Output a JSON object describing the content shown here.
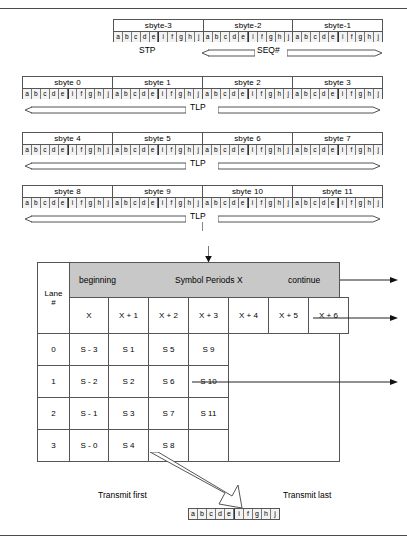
{
  "figure": {
    "bit_labels": [
      "a",
      "b",
      "c",
      "d",
      "e",
      "i",
      "f",
      "g",
      "h",
      "j"
    ],
    "colors": {
      "header_band_gray": "#c8c8c8",
      "cell_gray": "#f2f2f2",
      "line": "#555555",
      "rule": "#4c4c4c"
    }
  },
  "rows": [
    {
      "name": "stp-seq-row",
      "sbytes": [
        "sbyte-3",
        "sbyte-2",
        "sbyte-1"
      ],
      "annotations": {
        "left_label": "STP",
        "right_label": "SEQ#"
      }
    },
    {
      "name": "tlp-row-0",
      "sbytes": [
        "sbyte 0",
        "sbyte 1",
        "sbyte 2",
        "sbyte 3"
      ],
      "annotations": {
        "center_label": "TLP"
      }
    },
    {
      "name": "tlp-row-1",
      "sbytes": [
        "sbyte 4",
        "sbyte 5",
        "sbyte 6",
        "sbyte 7"
      ],
      "annotations": {
        "center_label": "TLP"
      }
    },
    {
      "name": "tlp-row-2",
      "sbytes": [
        "sbyte 8",
        "sbyte 9",
        "sbyte 10",
        "sbyte 11"
      ],
      "annotations": {
        "center_label": "TLP"
      }
    }
  ],
  "lane_table": {
    "band_labels": {
      "beginning": "beginning",
      "middle": "Symbol Periods X",
      "continue": "continue"
    },
    "lane_header": {
      "line1": "Lane",
      "line2": "#"
    },
    "symbol_period_columns": [
      "X",
      "X + 1",
      "X + 2",
      "X + 3",
      "X + 4",
      "X + 5",
      "X + 6"
    ],
    "lane_rows": [
      {
        "lane": "0",
        "cells": [
          "S - 3",
          "S 1",
          "S 5",
          "S 9"
        ]
      },
      {
        "lane": "1",
        "cells": [
          "S - 2",
          "S 2",
          "S 6",
          "S 10"
        ]
      },
      {
        "lane": "2",
        "cells": [
          "S - 1",
          "S 3",
          "S 7",
          "S 11"
        ]
      },
      {
        "lane": "3",
        "cells": [
          "S - 0",
          "S 4",
          "S 8",
          ""
        ]
      }
    ]
  },
  "transmit": {
    "first_label": "Transmit first",
    "last_label": "Transmit last",
    "bit_labels": [
      "a",
      "b",
      "c",
      "d",
      "e",
      "i",
      "f",
      "g",
      "h",
      "j"
    ]
  }
}
